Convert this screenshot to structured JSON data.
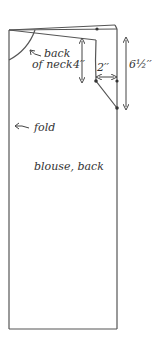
{
  "diagram": {
    "title": "blouse, back",
    "labels": {
      "neck": [
        "back",
        "of neck"
      ],
      "fold": "fold",
      "piece": "blouse, back"
    },
    "dimensions": {
      "neck_drop": "4′′",
      "shoulder_in": "2′′",
      "armhole_depth": "6½′′"
    },
    "colors": {
      "line": "#555555",
      "text": "#333333",
      "background": "#ffffff"
    }
  }
}
